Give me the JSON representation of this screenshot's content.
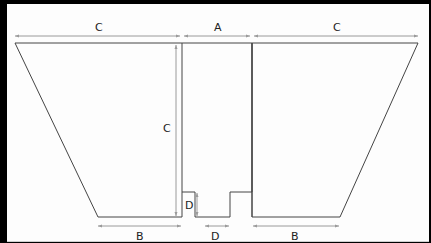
{
  "diagram": {
    "labels": {
      "top_left_width": "C",
      "top_middle_width": "A",
      "top_right_width": "C",
      "height": "C",
      "bottom_left_width": "B",
      "bottom_right_width": "B",
      "notch_height": "D",
      "notch_width": "D"
    },
    "colors": {
      "outline": "#444444",
      "dimension_line": "#9a9a9a",
      "background": "#fdfdfd",
      "frame": "#000000"
    }
  }
}
